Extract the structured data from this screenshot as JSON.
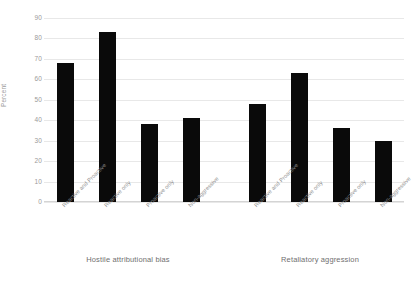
{
  "chart_data": {
    "type": "bar",
    "title": "",
    "xlabel": "",
    "ylabel": "Percent",
    "ylim": [
      0,
      90
    ],
    "ytick_step": 10,
    "yticks": [
      90,
      80,
      70,
      60,
      50,
      40,
      30,
      20,
      10,
      0
    ],
    "grid": true,
    "legend": "none",
    "bar_color": "#0a0a0a",
    "categories": [
      "Reactive and Proactive",
      "Reactive only",
      "Proactive only",
      "Non-aggressive"
    ],
    "groups": [
      {
        "name": "Hostile attributional bias",
        "values": [
          68,
          83,
          38,
          41
        ]
      },
      {
        "name": "Retaliatory aggression",
        "values": [
          48,
          63,
          36,
          30
        ]
      }
    ]
  }
}
